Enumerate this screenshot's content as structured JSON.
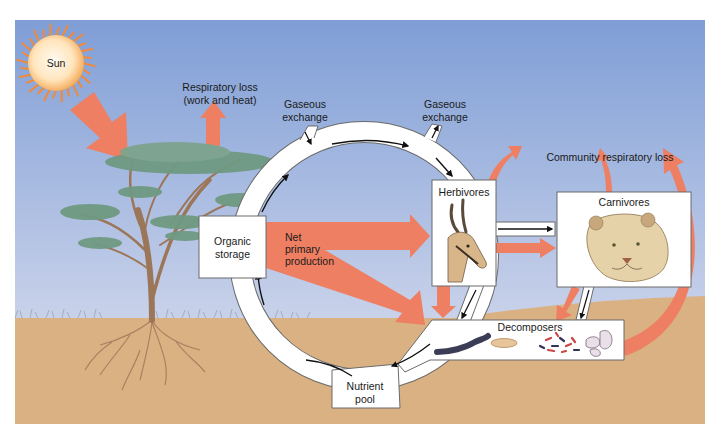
{
  "diagram": {
    "labels": {
      "sun": "Sun",
      "respiratory_loss_line1": "Respiratory loss",
      "respiratory_loss_line2": "(work and heat)",
      "gaseous_exchange_left_line1": "Gaseous",
      "gaseous_exchange_left_line2": "exchange",
      "gaseous_exchange_right_line1": "Gaseous",
      "gaseous_exchange_right_line2": "exchange",
      "community_respiratory_loss": "Community respiratory loss",
      "organic_storage_line1": "Organic",
      "organic_storage_line2": "storage",
      "net_primary_production_line1": "Net",
      "net_primary_production_line2": "primary",
      "net_primary_production_line3": "production",
      "herbivores": "Herbivores",
      "carnivores": "Carnivores",
      "decomposers": "Decomposers",
      "nutrient_pool_line1": "Nutrient",
      "nutrient_pool_line2": "pool"
    },
    "colors": {
      "sky_top": "#7f9ed6",
      "sky_bottom": "#c6d0ea",
      "soil": "#d9b183",
      "energy_arrow": "#ee7f62",
      "sun_core": "#fff3dc",
      "sun_edge": "#f4a24a",
      "canopy": "#6f9a82",
      "trunk": "#9c7658"
    },
    "nodes": [
      "Organic storage",
      "Herbivores",
      "Carnivores",
      "Decomposers",
      "Nutrient pool"
    ],
    "energy_flows": [
      {
        "from": "Sun",
        "to": "Producer (tree)"
      },
      {
        "from": "Producer (tree)",
        "to": "Respiratory loss (work and heat)"
      },
      {
        "from": "Net primary production",
        "to": "Herbivores"
      },
      {
        "from": "Net primary production",
        "to": "Decomposers"
      },
      {
        "from": "Herbivores",
        "to": "Carnivores"
      },
      {
        "from": "Herbivores",
        "to": "Decomposers"
      },
      {
        "from": "Carnivores",
        "to": "Decomposers"
      },
      {
        "from": "Herbivores",
        "to": "Community respiratory loss"
      },
      {
        "from": "Carnivores",
        "to": "Community respiratory loss"
      },
      {
        "from": "Decomposers",
        "to": "Community respiratory loss"
      }
    ],
    "nutrient_flows": [
      {
        "from": "Nutrient pool",
        "to": "Organic storage"
      },
      {
        "from": "Organic storage",
        "to": "Herbivores"
      },
      {
        "from": "Herbivores",
        "to": "Carnivores"
      },
      {
        "from": "Herbivores",
        "to": "Decomposers"
      },
      {
        "from": "Carnivores",
        "to": "Decomposers"
      },
      {
        "from": "Decomposers",
        "to": "Nutrient pool"
      }
    ]
  }
}
